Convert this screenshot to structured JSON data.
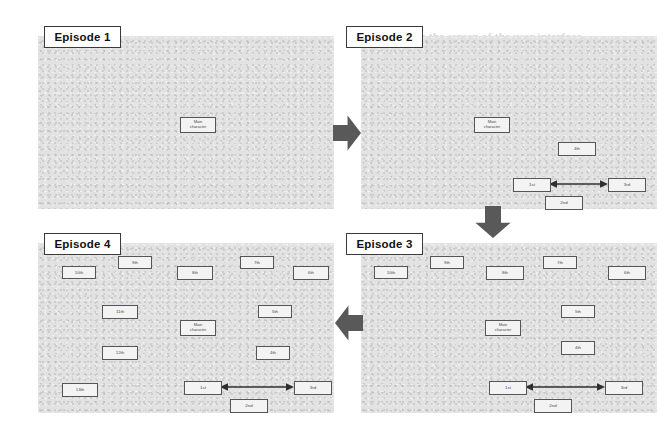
{
  "figure": {
    "background_color": "#ffffff",
    "panel_color": "#e2e2e2",
    "node_fill": "#f3f3f3",
    "node_stroke": "#555555",
    "arrow_color": "#595959"
  },
  "bleed_text": [
    {
      "text": "placed on the screen of the user interface",
      "x": 378,
      "y": 30,
      "size": 11
    },
    {
      "text": "with two more units for",
      "x": 378,
      "y": 50,
      "size": 11
    },
    {
      "text": "Example",
      "x": 420,
      "y": 172,
      "size": 13
    },
    {
      "text": "The Game",
      "x": 420,
      "y": 352,
      "size": 11
    }
  ],
  "panels": [
    {
      "id": "episode-1",
      "label": "Episode 1",
      "title_box": {
        "x": 44,
        "y": 26,
        "w": 75,
        "h": 20
      },
      "frame": {
        "x": 38,
        "y": 36,
        "w": 296,
        "h": 173
      },
      "nodes": [
        {
          "name": "main-character",
          "label": "Main\ncharacter",
          "x": 180,
          "y": 117,
          "w": 34,
          "h": 14,
          "type": "main"
        }
      ],
      "connectors": []
    },
    {
      "id": "episode-2",
      "label": "Episode 2",
      "title_box": {
        "x": 346,
        "y": 26,
        "w": 75,
        "h": 20
      },
      "frame": {
        "x": 361,
        "y": 36,
        "w": 296,
        "h": 173
      },
      "nodes": [
        {
          "name": "main-character",
          "label": "Main\ncharacter",
          "x": 474,
          "y": 117,
          "w": 34,
          "h": 14,
          "type": "main"
        },
        {
          "name": "node-4th",
          "label": "4th",
          "x": 558,
          "y": 142,
          "w": 36,
          "h": 12,
          "type": "rank"
        },
        {
          "name": "node-1st",
          "label": "1st",
          "x": 513,
          "y": 178,
          "w": 36,
          "h": 12,
          "type": "rank"
        },
        {
          "name": "node-3rd",
          "label": "3rd",
          "x": 608,
          "y": 178,
          "w": 36,
          "h": 12,
          "type": "rank"
        },
        {
          "name": "node-2nd",
          "label": "2nd",
          "x": 545,
          "y": 196,
          "w": 36,
          "h": 12,
          "type": "rank"
        }
      ],
      "connectors": [
        {
          "name": "link-1st-3rd",
          "x1": 549,
          "y1": 184,
          "x2": 608,
          "y2": 184
        }
      ]
    },
    {
      "id": "episode-3",
      "label": "Episode 3",
      "title_box": {
        "x": 346,
        "y": 233,
        "w": 75,
        "h": 20
      },
      "frame": {
        "x": 361,
        "y": 243,
        "w": 296,
        "h": 170
      },
      "nodes": [
        {
          "name": "node-10th",
          "label": "10th",
          "x": 374,
          "y": 266,
          "w": 32,
          "h": 11,
          "type": "rank"
        },
        {
          "name": "node-9th",
          "label": "9th",
          "x": 430,
          "y": 256,
          "w": 32,
          "h": 11,
          "type": "rank"
        },
        {
          "name": "node-8th",
          "label": "8th",
          "x": 486,
          "y": 266,
          "w": 36,
          "h": 12,
          "type": "rank"
        },
        {
          "name": "node-7th",
          "label": "7th",
          "x": 543,
          "y": 256,
          "w": 32,
          "h": 11,
          "type": "rank"
        },
        {
          "name": "node-6th",
          "label": "6th",
          "x": 608,
          "y": 266,
          "w": 36,
          "h": 12,
          "type": "rank"
        },
        {
          "name": "node-5th",
          "label": "5th",
          "x": 561,
          "y": 305,
          "w": 32,
          "h": 11,
          "type": "rank"
        },
        {
          "name": "main-character",
          "label": "Main\ncharacter",
          "x": 485,
          "y": 320,
          "w": 34,
          "h": 14,
          "type": "main"
        },
        {
          "name": "node-4th",
          "label": "4th",
          "x": 561,
          "y": 341,
          "w": 32,
          "h": 12,
          "type": "rank"
        },
        {
          "name": "node-1st",
          "label": "1st",
          "x": 489,
          "y": 381,
          "w": 36,
          "h": 12,
          "type": "rank"
        },
        {
          "name": "node-3rd",
          "label": "3rd",
          "x": 605,
          "y": 381,
          "w": 36,
          "h": 12,
          "type": "rank"
        },
        {
          "name": "node-2nd",
          "label": "2nd",
          "x": 534,
          "y": 399,
          "w": 36,
          "h": 12,
          "type": "rank"
        }
      ],
      "connectors": [
        {
          "name": "link-1st-3rd",
          "x1": 525,
          "y1": 387,
          "x2": 605,
          "y2": 387
        }
      ]
    },
    {
      "id": "episode-4",
      "label": "Episode 4",
      "title_box": {
        "x": 44,
        "y": 233,
        "w": 75,
        "h": 20
      },
      "frame": {
        "x": 38,
        "y": 243,
        "w": 296,
        "h": 170
      },
      "nodes": [
        {
          "name": "node-10th",
          "label": "10th",
          "x": 62,
          "y": 266,
          "w": 32,
          "h": 11,
          "type": "rank"
        },
        {
          "name": "node-9th",
          "label": "9th",
          "x": 118,
          "y": 256,
          "w": 32,
          "h": 11,
          "type": "rank"
        },
        {
          "name": "node-8th",
          "label": "8th",
          "x": 177,
          "y": 266,
          "w": 34,
          "h": 12,
          "type": "rank"
        },
        {
          "name": "node-7th",
          "label": "7th",
          "x": 240,
          "y": 256,
          "w": 32,
          "h": 11,
          "type": "rank"
        },
        {
          "name": "node-6th",
          "label": "6th",
          "x": 293,
          "y": 266,
          "w": 34,
          "h": 12,
          "type": "rank"
        },
        {
          "name": "node-11th",
          "label": "11th",
          "x": 102,
          "y": 305,
          "w": 34,
          "h": 12,
          "type": "rank"
        },
        {
          "name": "node-5th",
          "label": "5th",
          "x": 258,
          "y": 305,
          "w": 32,
          "h": 11,
          "type": "rank"
        },
        {
          "name": "main-character",
          "label": "Main\ncharacter",
          "x": 180,
          "y": 320,
          "w": 34,
          "h": 14,
          "type": "main"
        },
        {
          "name": "node-12th",
          "label": "12th",
          "x": 102,
          "y": 346,
          "w": 34,
          "h": 12,
          "type": "rank"
        },
        {
          "name": "node-4th",
          "label": "4th",
          "x": 256,
          "y": 346,
          "w": 32,
          "h": 12,
          "type": "rank"
        },
        {
          "name": "node-13th",
          "label": "13th",
          "x": 62,
          "y": 383,
          "w": 34,
          "h": 12,
          "type": "rank"
        },
        {
          "name": "node-1st",
          "label": "1st",
          "x": 184,
          "y": 381,
          "w": 36,
          "h": 12,
          "type": "rank"
        },
        {
          "name": "node-3rd",
          "label": "3rd",
          "x": 294,
          "y": 381,
          "w": 36,
          "h": 12,
          "type": "rank"
        },
        {
          "name": "node-2nd",
          "label": "2nd",
          "x": 230,
          "y": 399,
          "w": 36,
          "h": 12,
          "type": "rank"
        }
      ],
      "connectors": [
        {
          "name": "link-1st-3rd",
          "x1": 220,
          "y1": 387,
          "x2": 294,
          "y2": 387
        }
      ]
    }
  ],
  "flow_arrows": [
    {
      "name": "flow-arrow-right",
      "direction": "right",
      "x": 333,
      "y": 113,
      "w": 28,
      "h": 40
    },
    {
      "name": "flow-arrow-down",
      "direction": "down",
      "x": 473,
      "y": 206,
      "w": 40,
      "h": 32
    },
    {
      "name": "flow-arrow-left",
      "direction": "left",
      "x": 335,
      "y": 303,
      "w": 28,
      "h": 40
    }
  ]
}
